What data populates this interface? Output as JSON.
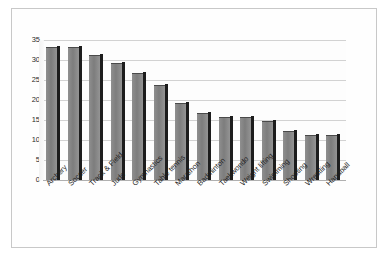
{
  "chart_data": {
    "type": "bar",
    "title": "",
    "subtitle": "",
    "xlabel": "",
    "ylabel": "",
    "ylim": [
      0,
      35
    ],
    "yticks": [
      0,
      5,
      10,
      15,
      20,
      25,
      30,
      35
    ],
    "ytick_labels": [
      "0",
      "5",
      "10",
      "15",
      "20",
      "25",
      "30",
      "35"
    ],
    "grid": true,
    "legend": false,
    "legend_position": "none",
    "orientation": "vertical",
    "style": "3d-column",
    "categories": [
      "Archery",
      "Soccer",
      "Track & Field",
      "Judo",
      "Gymnastics",
      "Table tennis",
      "Marathon",
      "Badminton",
      "Taekwondo",
      "Weight lifting",
      "Swimming",
      "Shooting",
      "Wrestling",
      "Handball"
    ],
    "values": [
      33,
      33,
      31,
      29,
      26.5,
      23.5,
      19,
      16.5,
      15.5,
      15.5,
      14.5,
      12,
      11,
      11
    ],
    "series": [
      {
        "name": "Count",
        "values": [
          33,
          33,
          31,
          29,
          26.5,
          23.5,
          19,
          16.5,
          15.5,
          15.5,
          14.5,
          12,
          11,
          11
        ]
      }
    ],
    "colors": {
      "bar_face": "#8a8a8a",
      "bar_side": "#1d1d1d",
      "bar_top": "#5a5a5a",
      "gridline": "#d2d2d2",
      "axis": "#aaaaaa",
      "plot_background": "#fdfdfd",
      "frame_border": "#c8c8c8",
      "text": "#1f1f1f"
    }
  }
}
